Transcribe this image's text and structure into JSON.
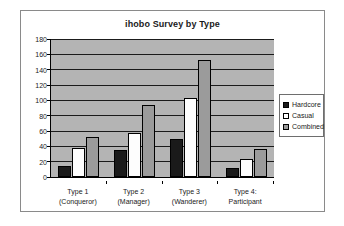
{
  "chart_data": {
    "type": "bar",
    "title": "ihobo Survey by Type",
    "xlabel": "",
    "ylabel": "",
    "ylim": [
      0,
      180
    ],
    "yticks": [
      0,
      20,
      40,
      60,
      80,
      100,
      120,
      140,
      160,
      180
    ],
    "grid": true,
    "legend_position": "right",
    "categories": [
      "Type 1\n(Conqueror)",
      "Type 2\n(Manager)",
      "Type 3\n(Wanderer)",
      "Type 4:\nParticipant"
    ],
    "category_lines": [
      [
        "Type 1",
        "(Conqueror)"
      ],
      [
        "Type 2",
        "(Manager)"
      ],
      [
        "Type 3",
        "(Wanderer)"
      ],
      [
        "Type 4:",
        "Participant"
      ]
    ],
    "series": [
      {
        "name": "Hardcore",
        "color": "#1a1a1a",
        "values": [
          15,
          35,
          49,
          12
        ]
      },
      {
        "name": "Casual",
        "color": "#ffffff",
        "values": [
          38,
          58,
          103,
          24
        ]
      },
      {
        "name": "Combined",
        "color": "#9b9b9b",
        "values": [
          52,
          94,
          152,
          36
        ]
      }
    ]
  },
  "legend": {
    "items": [
      {
        "label": "Hardcore"
      },
      {
        "label": "Casual"
      },
      {
        "label": "Combined"
      }
    ]
  }
}
